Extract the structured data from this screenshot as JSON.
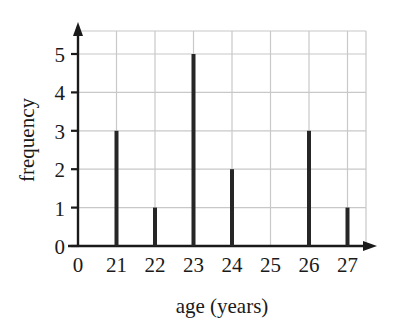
{
  "chart_data": {
    "type": "bar",
    "title": "",
    "subtitle": "",
    "xlabel": "age (years)",
    "ylabel": "frequency",
    "categories": [
      "21",
      "22",
      "23",
      "24",
      "25",
      "26",
      "27"
    ],
    "values": [
      3,
      1,
      5,
      2,
      0,
      3,
      1
    ],
    "x_tick_labels": [
      "0",
      "21",
      "22",
      "23",
      "24",
      "25",
      "26",
      "27"
    ],
    "y_tick_labels": [
      "0",
      "1",
      "2",
      "3",
      "4",
      "5"
    ],
    "y_ticks": [
      0,
      1,
      2,
      3,
      4,
      5
    ],
    "ylim": [
      0,
      5.7
    ],
    "xlim_labels": [
      "0",
      "27"
    ],
    "grid": true,
    "legend": null,
    "annotations": [],
    "series": [
      {
        "name": "frequency",
        "values": [
          3,
          1,
          5,
          2,
          0,
          3,
          1
        ]
      }
    ]
  },
  "style": {
    "axis_color": "#1a1a1a",
    "grid_color": "#c8c8c8",
    "bar_color": "#262626",
    "background": "#ffffff",
    "text_color": "#1a1a1a"
  },
  "geometry": {
    "origin_x": 78,
    "origin_y": 246,
    "x_step": 38.5,
    "y_step": 38.4,
    "grid_right": 366,
    "grid_top": 31,
    "bar_width": 4
  }
}
